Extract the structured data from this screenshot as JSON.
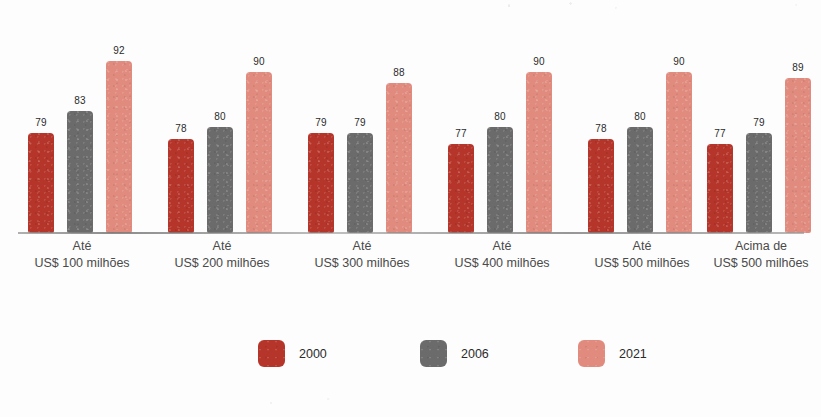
{
  "chart_data": {
    "type": "bar",
    "title": "",
    "subtitle": "",
    "xlabel": "",
    "ylabel": "",
    "grid": false,
    "legend_position": "bottom-center",
    "axis_truncated": true,
    "value_axis_min_implied": 70,
    "value_axis_max_implied": 95,
    "categories": [
      {
        "line1": "Até",
        "line2": "US$ 100 milhões"
      },
      {
        "line1": "Até",
        "line2": "US$ 200 milhões"
      },
      {
        "line1": "Até",
        "line2": "US$ 300 milhões"
      },
      {
        "line1": "Até",
        "line2": "US$ 400 milhões"
      },
      {
        "line1": "Até",
        "line2": "US$ 500 milhões"
      },
      {
        "line1": "Acima de",
        "line2": "US$ 500 milhões"
      }
    ],
    "series": [
      {
        "name": "2000",
        "color": "#b5352a",
        "values": [
          79,
          78,
          79,
          77,
          78,
          77
        ]
      },
      {
        "name": "2006",
        "color": "#6b6b6b",
        "values": [
          83,
          80,
          79,
          80,
          80,
          79
        ]
      },
      {
        "name": "2021",
        "color": "#e08b7e",
        "values": [
          92,
          90,
          88,
          90,
          90,
          89
        ]
      }
    ]
  },
  "legend": {
    "items": [
      {
        "label": "2000",
        "color": "#b5352a"
      },
      {
        "label": "2006",
        "color": "#6b6b6b"
      },
      {
        "label": "2021",
        "color": "#e08b7e"
      }
    ]
  }
}
